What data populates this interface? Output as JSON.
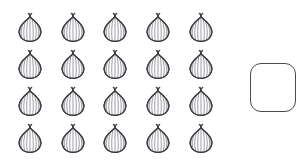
{
  "page": {
    "background_color": "#ffffff",
    "width": 300,
    "height": 165
  },
  "objects": {
    "name": "onion",
    "icon": "onion-icon",
    "total_count": 20,
    "rows": 4,
    "columns": 5,
    "outline_color": "#3a3a40",
    "fill_color": "#ffffff",
    "shading_color": "#9a9aa0",
    "cells": [
      {
        "row": 1,
        "col": 1,
        "x": 17,
        "y": 12
      },
      {
        "row": 1,
        "col": 2,
        "x": 60,
        "y": 12
      },
      {
        "row": 1,
        "col": 3,
        "x": 102,
        "y": 12
      },
      {
        "row": 1,
        "col": 4,
        "x": 145,
        "y": 12
      },
      {
        "row": 1,
        "col": 5,
        "x": 188,
        "y": 12
      },
      {
        "row": 2,
        "col": 1,
        "x": 17,
        "y": 49
      },
      {
        "row": 2,
        "col": 2,
        "x": 60,
        "y": 49
      },
      {
        "row": 2,
        "col": 3,
        "x": 102,
        "y": 49
      },
      {
        "row": 2,
        "col": 4,
        "x": 145,
        "y": 49
      },
      {
        "row": 2,
        "col": 5,
        "x": 188,
        "y": 49
      },
      {
        "row": 3,
        "col": 1,
        "x": 17,
        "y": 86
      },
      {
        "row": 3,
        "col": 2,
        "x": 60,
        "y": 86
      },
      {
        "row": 3,
        "col": 3,
        "x": 102,
        "y": 86
      },
      {
        "row": 3,
        "col": 4,
        "x": 145,
        "y": 86
      },
      {
        "row": 3,
        "col": 5,
        "x": 188,
        "y": 86
      },
      {
        "row": 4,
        "col": 1,
        "x": 17,
        "y": 123
      },
      {
        "row": 4,
        "col": 2,
        "x": 60,
        "y": 123
      },
      {
        "row": 4,
        "col": 3,
        "x": 102,
        "y": 123
      },
      {
        "row": 4,
        "col": 4,
        "x": 145,
        "y": 123
      },
      {
        "row": 4,
        "col": 5,
        "x": 188,
        "y": 123
      }
    ]
  },
  "answer_box": {
    "name": "answer-box",
    "value": "",
    "placeholder": "",
    "border_color": "#4a4a52",
    "fill_color": "#ffffff",
    "x": 250,
    "y": 63,
    "width": 46,
    "height": 49,
    "corner_radius": 11
  }
}
